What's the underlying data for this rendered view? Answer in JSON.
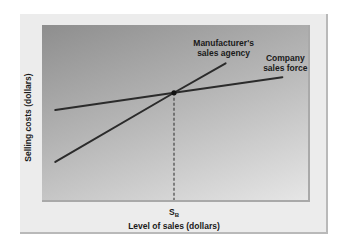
{
  "chart_data": {
    "type": "line",
    "title": "",
    "xlabel": "Level of sales (dollars)",
    "ylabel": "Selling costs (dollars)",
    "x_tick_labels": [
      {
        "label": "S",
        "subscript": "B",
        "x": 0.5
      }
    ],
    "xlim": [
      0,
      1
    ],
    "ylim": [
      0,
      1
    ],
    "grid": false,
    "series": [
      {
        "name": "Company sales force",
        "label_lines": [
          "Company",
          "sales force"
        ],
        "points": [
          [
            0.04,
            0.52
          ],
          [
            0.5,
            0.62
          ],
          [
            0.92,
            0.71
          ]
        ]
      },
      {
        "name": "Manufacturer's sales agency",
        "label_lines": [
          "Manufacturer's",
          "sales agency"
        ],
        "points": [
          [
            0.04,
            0.22
          ],
          [
            0.5,
            0.62
          ],
          [
            0.7,
            0.79
          ]
        ]
      }
    ],
    "annotations": [
      {
        "type": "intersection-point",
        "x": 0.5,
        "y": 0.62
      },
      {
        "type": "dashed-vertical",
        "x": 0.5,
        "from_y": 0,
        "to_y": 0.62,
        "label": "Break-even sales level S_B"
      }
    ],
    "colors": {
      "line": "#2b2b2b",
      "plot_bg_dark": "#8e8e8e",
      "plot_bg_light": "#e6e6e6",
      "frame_bg": "#ececec"
    }
  }
}
